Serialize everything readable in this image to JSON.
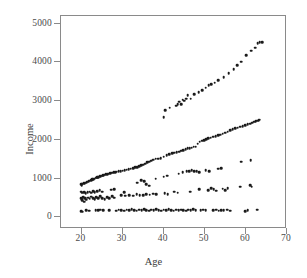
{
  "chart_data": {
    "type": "scatter",
    "title": "",
    "xlabel": "Age",
    "ylabel": "Income",
    "xlim": [
      15,
      70
    ],
    "ylim": [
      -300,
      5200
    ],
    "xticks": [
      20,
      30,
      40,
      50,
      60,
      70
    ],
    "yticks": [
      0,
      1000,
      2000,
      3000,
      4000,
      5000
    ],
    "xticklabels": [
      "20",
      "30",
      "40",
      "50",
      "60",
      "70"
    ],
    "yticklabels": [
      "0",
      "1000",
      "2000",
      "3000",
      "4000",
      "5000"
    ],
    "grid": false,
    "legend": null,
    "marker": "filled-circle",
    "marker_color": "#1a1a1a",
    "marker_size": 2.6,
    "frame_color": "#8a8a8a",
    "background": "#ffffff",
    "series": [
      {
        "name": "upper-band",
        "points": [
          [
            40.0,
            2590
          ],
          [
            40.4,
            2760
          ],
          [
            41.5,
            2830
          ],
          [
            43.0,
            2880
          ],
          [
            43.4,
            2930
          ],
          [
            43.8,
            2990
          ],
          [
            44.2,
            2930
          ],
          [
            44.6,
            3040
          ],
          [
            45.0,
            3010
          ],
          [
            45.4,
            3060
          ],
          [
            45.8,
            3150
          ],
          [
            46.6,
            3060
          ],
          [
            47.4,
            3180
          ],
          [
            48.5,
            3230
          ],
          [
            49.3,
            3290
          ],
          [
            50.2,
            3350
          ],
          [
            50.9,
            3420
          ],
          [
            51.6,
            3440
          ],
          [
            52.4,
            3480
          ],
          [
            53.2,
            3540
          ],
          [
            54.6,
            3620
          ],
          [
            55.8,
            3720
          ],
          [
            57.0,
            3820
          ],
          [
            57.9,
            3930
          ],
          [
            58.8,
            4020
          ],
          [
            60.0,
            4190
          ],
          [
            61.3,
            4300
          ],
          [
            62.2,
            4380
          ],
          [
            62.9,
            4500
          ],
          [
            63.4,
            4520
          ],
          [
            63.9,
            4530
          ]
        ]
      },
      {
        "name": "main-band",
        "points": [
          [
            19.9,
            850
          ],
          [
            20.0,
            830
          ],
          [
            20.2,
            870
          ],
          [
            20.5,
            880
          ],
          [
            20.8,
            890
          ],
          [
            21.1,
            900
          ],
          [
            21.4,
            920
          ],
          [
            21.7,
            930
          ],
          [
            22.0,
            950
          ],
          [
            22.3,
            960
          ],
          [
            22.6,
            980
          ],
          [
            22.9,
            990
          ],
          [
            23.2,
            1000
          ],
          [
            23.5,
            1020
          ],
          [
            23.8,
            1030
          ],
          [
            24.1,
            1040
          ],
          [
            24.4,
            1060
          ],
          [
            24.7,
            1070
          ],
          [
            25.0,
            1080
          ],
          [
            25.3,
            1090
          ],
          [
            25.6,
            1100
          ],
          [
            25.9,
            1110
          ],
          [
            26.2,
            1120
          ],
          [
            26.6,
            1130
          ],
          [
            27.0,
            1140
          ],
          [
            27.4,
            1150
          ],
          [
            27.8,
            1160
          ],
          [
            28.2,
            1170
          ],
          [
            28.6,
            1180
          ],
          [
            29.0,
            1190
          ],
          [
            29.5,
            1200
          ],
          [
            30.0,
            1210
          ],
          [
            30.5,
            1220
          ],
          [
            31.0,
            1230
          ],
          [
            31.5,
            1250
          ],
          [
            32.0,
            1260
          ],
          [
            32.5,
            1270
          ],
          [
            33.0,
            1290
          ],
          [
            33.5,
            1300
          ],
          [
            34.0,
            1320
          ],
          [
            34.5,
            1340
          ],
          [
            35.0,
            1360
          ],
          [
            35.5,
            1390
          ],
          [
            36.0,
            1420
          ],
          [
            36.5,
            1440
          ],
          [
            37.0,
            1460
          ],
          [
            37.5,
            1490
          ],
          [
            38.0,
            1510
          ],
          [
            38.6,
            1520
          ],
          [
            39.3,
            1530
          ],
          [
            40.0,
            1570
          ],
          [
            40.7,
            1600
          ],
          [
            41.4,
            1630
          ],
          [
            42.0,
            1650
          ],
          [
            42.6,
            1670
          ],
          [
            43.2,
            1690
          ],
          [
            43.8,
            1700
          ],
          [
            44.3,
            1720
          ],
          [
            44.8,
            1740
          ],
          [
            45.3,
            1760
          ],
          [
            45.8,
            1780
          ],
          [
            46.3,
            1790
          ],
          [
            46.8,
            1800
          ],
          [
            47.3,
            1820
          ],
          [
            47.8,
            1830
          ],
          [
            48.3,
            1900
          ],
          [
            48.8,
            1950
          ],
          [
            49.3,
            1980
          ],
          [
            49.8,
            2000
          ],
          [
            50.3,
            2020
          ],
          [
            50.8,
            2040
          ],
          [
            51.4,
            2060
          ],
          [
            52.0,
            2080
          ],
          [
            52.6,
            2100
          ],
          [
            53.2,
            2120
          ],
          [
            53.8,
            2140
          ],
          [
            54.4,
            2160
          ],
          [
            55.0,
            2190
          ],
          [
            55.6,
            2210
          ],
          [
            56.2,
            2250
          ],
          [
            56.8,
            2270
          ],
          [
            57.4,
            2300
          ],
          [
            58.0,
            2320
          ],
          [
            58.6,
            2340
          ],
          [
            59.2,
            2360
          ],
          [
            59.8,
            2380
          ],
          [
            60.4,
            2400
          ],
          [
            61.0,
            2420
          ],
          [
            61.5,
            2450
          ],
          [
            62.0,
            2470
          ],
          [
            62.4,
            2490
          ],
          [
            62.8,
            2500
          ],
          [
            63.1,
            2510
          ],
          [
            63.4,
            2520
          ]
        ]
      },
      {
        "name": "scatter-mid",
        "points": [
          [
            19.9,
            660
          ],
          [
            20.2,
            640
          ],
          [
            20.6,
            650
          ],
          [
            21.0,
            620
          ],
          [
            21.5,
            650
          ],
          [
            22.0,
            660
          ],
          [
            22.4,
            640
          ],
          [
            22.8,
            680
          ],
          [
            23.2,
            650
          ],
          [
            23.8,
            670
          ],
          [
            24.4,
            700
          ],
          [
            25.0,
            660
          ],
          [
            27.2,
            710
          ],
          [
            28.0,
            720
          ],
          [
            30.4,
            650
          ],
          [
            33.6,
            900
          ],
          [
            34.5,
            960
          ],
          [
            35.2,
            940
          ],
          [
            35.8,
            850
          ],
          [
            36.4,
            820
          ],
          [
            38.0,
            1000
          ],
          [
            40.0,
            1050
          ],
          [
            40.8,
            1080
          ],
          [
            43.6,
            1130
          ],
          [
            44.6,
            1160
          ],
          [
            45.6,
            1190
          ],
          [
            46.2,
            1200
          ],
          [
            46.8,
            1220
          ],
          [
            47.4,
            1190
          ],
          [
            48.0,
            1200
          ],
          [
            48.6,
            1170
          ],
          [
            50.2,
            1220
          ],
          [
            51.0,
            1200
          ],
          [
            53.2,
            1260
          ],
          [
            54.0,
            1270
          ],
          [
            58.8,
            1440
          ],
          [
            61.2,
            1470
          ]
        ]
      },
      {
        "name": "scatter-low",
        "points": [
          [
            19.9,
            500
          ],
          [
            20.0,
            470
          ],
          [
            20.2,
            440
          ],
          [
            20.4,
            520
          ],
          [
            20.6,
            400
          ],
          [
            20.9,
            490
          ],
          [
            21.2,
            460
          ],
          [
            21.6,
            510
          ],
          [
            22.0,
            480
          ],
          [
            22.4,
            530
          ],
          [
            22.8,
            500
          ],
          [
            23.2,
            470
          ],
          [
            23.6,
            520
          ],
          [
            24.0,
            500
          ],
          [
            24.5,
            540
          ],
          [
            25.0,
            490
          ],
          [
            25.6,
            470
          ],
          [
            26.2,
            520
          ],
          [
            26.8,
            500
          ],
          [
            27.4,
            540
          ],
          [
            28.0,
            510
          ],
          [
            29.6,
            570
          ],
          [
            30.6,
            560
          ],
          [
            31.6,
            580
          ],
          [
            32.6,
            560
          ],
          [
            33.4,
            600
          ],
          [
            34.2,
            580
          ],
          [
            35.0,
            570
          ],
          [
            35.8,
            600
          ],
          [
            36.6,
            590
          ],
          [
            37.4,
            610
          ],
          [
            38.2,
            600
          ],
          [
            40.2,
            620
          ],
          [
            41.0,
            600
          ],
          [
            42.6,
            660
          ],
          [
            43.4,
            640
          ],
          [
            46.4,
            660
          ],
          [
            48.6,
            730
          ],
          [
            50.8,
            700
          ],
          [
            51.6,
            760
          ],
          [
            52.2,
            720
          ],
          [
            52.8,
            690
          ],
          [
            54.4,
            740
          ],
          [
            55.0,
            700
          ],
          [
            55.6,
            760
          ],
          [
            58.6,
            790
          ],
          [
            61.0,
            830
          ],
          [
            61.4,
            790
          ]
        ]
      },
      {
        "name": "bottom-band",
        "points": [
          [
            19.9,
            160
          ],
          [
            20.3,
            150
          ],
          [
            21.2,
            180
          ],
          [
            21.8,
            170
          ],
          [
            23.4,
            180
          ],
          [
            24.0,
            190
          ],
          [
            24.6,
            200
          ],
          [
            25.2,
            180
          ],
          [
            26.8,
            190
          ],
          [
            28.4,
            170
          ],
          [
            29.0,
            200
          ],
          [
            29.6,
            190
          ],
          [
            30.4,
            170
          ],
          [
            31.0,
            200
          ],
          [
            31.6,
            180
          ],
          [
            32.2,
            210
          ],
          [
            32.8,
            190
          ],
          [
            33.4,
            170
          ],
          [
            34.0,
            200
          ],
          [
            34.6,
            180
          ],
          [
            35.2,
            210
          ],
          [
            35.8,
            190
          ],
          [
            36.4,
            170
          ],
          [
            37.0,
            200
          ],
          [
            37.6,
            180
          ],
          [
            38.2,
            210
          ],
          [
            38.8,
            190
          ],
          [
            39.4,
            170
          ],
          [
            40.0,
            200
          ],
          [
            40.6,
            180
          ],
          [
            41.2,
            210
          ],
          [
            41.8,
            190
          ],
          [
            42.4,
            170
          ],
          [
            43.0,
            200
          ],
          [
            43.6,
            180
          ],
          [
            44.2,
            200
          ],
          [
            44.8,
            190
          ],
          [
            45.4,
            170
          ],
          [
            46.0,
            200
          ],
          [
            46.6,
            180
          ],
          [
            47.2,
            210
          ],
          [
            47.8,
            190
          ],
          [
            49.0,
            180
          ],
          [
            49.6,
            200
          ],
          [
            50.2,
            190
          ],
          [
            52.0,
            180
          ],
          [
            52.8,
            200
          ],
          [
            53.4,
            170
          ],
          [
            54.0,
            190
          ],
          [
            54.6,
            180
          ],
          [
            55.4,
            200
          ],
          [
            56.2,
            170
          ],
          [
            59.8,
            160
          ],
          [
            60.4,
            180
          ],
          [
            62.8,
            200
          ]
        ]
      }
    ]
  }
}
